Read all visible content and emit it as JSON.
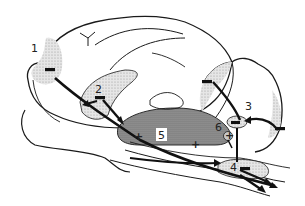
{
  "diagram": {
    "colors": {
      "outline": "#1a1a1a",
      "light_shade": "#d9d9d9",
      "dark_shade": "#8c8c8c",
      "marker": "#111111",
      "background": "#ffffff"
    },
    "regions": [
      {
        "id": "1",
        "label": "1",
        "shade": "light",
        "marker": "−"
      },
      {
        "id": "2",
        "label": "2",
        "shade": "light",
        "marker": "−"
      },
      {
        "id": "3",
        "label": "3",
        "shade": "light",
        "marker": "−"
      },
      {
        "id": "4",
        "label": "4",
        "shade": "light",
        "marker": "−"
      },
      {
        "id": "5",
        "label": "5",
        "shade": "dark",
        "marker": "+"
      },
      {
        "id": "6",
        "label": "6",
        "shade": "none",
        "marker": "+"
      }
    ],
    "markers": {
      "minus": "−",
      "plus": "+"
    },
    "labels": {
      "r1": "1",
      "r2": "2",
      "r3": "3",
      "r4": "4",
      "r5": "5",
      "r6": "6"
    }
  }
}
